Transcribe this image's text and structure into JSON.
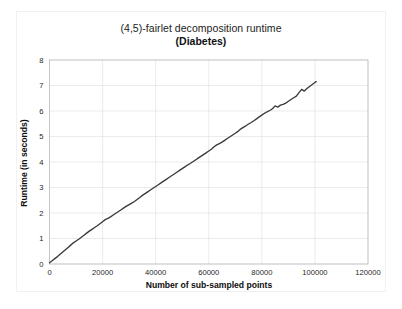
{
  "figure": {
    "title_main": "(4,5)-fairlet decomposition runtime",
    "title_sub": "(Diabetes)",
    "background_color": "#ffffff",
    "line_color": "#3a3a3a",
    "grid_color": "#e3e3e3",
    "frame_color": "#bdbdbd"
  },
  "chart_data": {
    "type": "line",
    "title": "(4,5)-fairlet decomposition runtime (Diabetes)",
    "xlabel": "Number of sub-sampled points",
    "ylabel": "Runtime (in seconds)",
    "xlim": [
      0,
      120000
    ],
    "ylim": [
      0,
      8
    ],
    "xticks": [
      0,
      20000,
      40000,
      60000,
      80000,
      100000,
      120000
    ],
    "xtick_labels": [
      "0",
      "20000",
      "40000",
      "60000",
      "80000",
      "100000",
      "120000"
    ],
    "yticks": [
      0,
      1,
      2,
      3,
      4,
      5,
      6,
      7,
      8
    ],
    "ytick_labels": [
      "0",
      "1",
      "2",
      "3",
      "4",
      "5",
      "6",
      "7",
      "8"
    ],
    "grid": true,
    "legend": null,
    "series": [
      {
        "name": "runtime",
        "color": "#3a3a3a",
        "x": [
          0,
          1000,
          2000,
          3000,
          4000,
          5000,
          6000,
          7000,
          8000,
          9000,
          10000,
          11000,
          12000,
          13000,
          14000,
          15000,
          16000,
          17000,
          18000,
          19000,
          20000,
          21000,
          22000,
          23000,
          24000,
          25000,
          26000,
          27000,
          28000,
          29000,
          30000,
          31000,
          32000,
          33000,
          34000,
          35000,
          36000,
          37000,
          38000,
          39000,
          40000,
          41000,
          42000,
          43000,
          44000,
          45000,
          46000,
          47000,
          48000,
          49000,
          50000,
          51000,
          52000,
          53000,
          54000,
          55000,
          56000,
          57000,
          58000,
          59000,
          60000,
          61000,
          62000,
          63000,
          64000,
          65000,
          66000,
          67000,
          68000,
          69000,
          70000,
          71000,
          72000,
          73000,
          74000,
          75000,
          76000,
          77000,
          78000,
          79000,
          80000,
          81000,
          82000,
          83000,
          84000,
          85000,
          86000,
          87000,
          88000,
          89000,
          90000,
          91000,
          92000,
          93000,
          94000,
          95000,
          96000,
          97000,
          98000,
          99000,
          100000,
          100500
        ],
        "y": [
          0.05,
          0.13,
          0.21,
          0.29,
          0.38,
          0.47,
          0.56,
          0.65,
          0.74,
          0.83,
          0.9,
          0.97,
          1.05,
          1.13,
          1.21,
          1.29,
          1.36,
          1.43,
          1.5,
          1.58,
          1.66,
          1.74,
          1.79,
          1.85,
          1.92,
          1.99,
          2.06,
          2.13,
          2.2,
          2.27,
          2.33,
          2.39,
          2.45,
          2.53,
          2.61,
          2.69,
          2.76,
          2.83,
          2.9,
          2.97,
          3.04,
          3.11,
          3.18,
          3.25,
          3.32,
          3.39,
          3.46,
          3.53,
          3.6,
          3.67,
          3.74,
          3.81,
          3.88,
          3.94,
          4.01,
          4.08,
          4.15,
          4.22,
          4.29,
          4.36,
          4.43,
          4.5,
          4.6,
          4.67,
          4.72,
          4.78,
          4.85,
          4.92,
          4.99,
          5.06,
          5.13,
          5.2,
          5.29,
          5.36,
          5.42,
          5.49,
          5.55,
          5.62,
          5.69,
          5.77,
          5.84,
          5.91,
          5.97,
          6.02,
          6.09,
          6.2,
          6.15,
          6.23,
          6.26,
          6.31,
          6.38,
          6.45,
          6.52,
          6.58,
          6.72,
          6.85,
          6.78,
          6.88,
          6.96,
          7.04,
          7.12,
          7.15
        ]
      }
    ]
  }
}
